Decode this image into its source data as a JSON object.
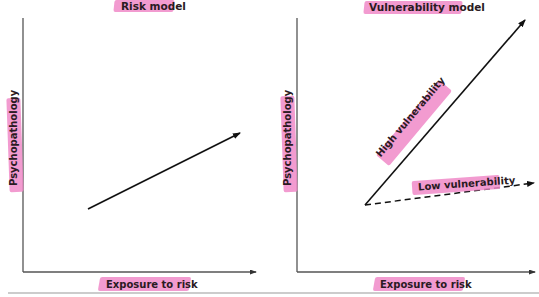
{
  "figure": {
    "divider_color": "#999999",
    "highlight_color": "#f08ac8",
    "line_color": "#111111"
  },
  "panels": [
    {
      "title": "Risk model",
      "x_axis_label": "Exposure to risk",
      "y_axis_label": "Psychopathology",
      "lines": [
        {
          "name": "risk",
          "style": "solid",
          "label": ""
        }
      ]
    },
    {
      "title": "Vulnerability model",
      "x_axis_label": "Exposure to risk",
      "y_axis_label": "Psychopathology",
      "lines": [
        {
          "name": "high",
          "style": "solid",
          "label": "High vulnerability"
        },
        {
          "name": "low",
          "style": "dashed",
          "label": "Low vulnerability"
        }
      ]
    }
  ]
}
